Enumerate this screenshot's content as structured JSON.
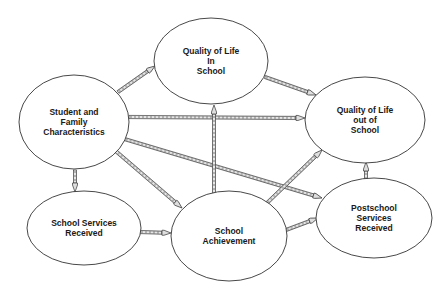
{
  "diagram": {
    "type": "path-model",
    "colors": {
      "stroke": "#333333",
      "arrow_fill": "#cfcfcf",
      "background": "#ffffff"
    },
    "nodes": [
      {
        "id": "qol_in",
        "lines": [
          "Quality of Life",
          "In",
          "School"
        ],
        "cx": 211,
        "cy": 61,
        "rx": 57,
        "ry": 43
      },
      {
        "id": "sfc",
        "lines": [
          "Student and",
          "Family",
          "Characteristics"
        ],
        "cx": 74,
        "cy": 122,
        "rx": 55,
        "ry": 47
      },
      {
        "id": "qol_out",
        "lines": [
          "Quality of Life",
          "out of",
          "School"
        ],
        "cx": 365,
        "cy": 120,
        "rx": 60,
        "ry": 43
      },
      {
        "id": "ssr",
        "lines": [
          "School Services",
          "Received"
        ],
        "cx": 84,
        "cy": 228,
        "rx": 57,
        "ry": 37
      },
      {
        "id": "sa",
        "lines": [
          "School",
          "Achievement"
        ],
        "cx": 229,
        "cy": 236,
        "rx": 58,
        "ry": 45
      },
      {
        "id": "psr",
        "lines": [
          "Postschool",
          "Services",
          "Received"
        ],
        "cx": 374,
        "cy": 218,
        "rx": 58,
        "ry": 40
      }
    ],
    "edges": [
      {
        "from": "sfc",
        "to": "qol_in",
        "x1": 118,
        "y1": 92,
        "x2": 155,
        "y2": 66
      },
      {
        "from": "sfc",
        "to": "qol_out",
        "x1": 129,
        "y1": 117,
        "x2": 305,
        "y2": 118
      },
      {
        "from": "sfc",
        "to": "ssr",
        "x1": 75,
        "y1": 170,
        "x2": 75,
        "y2": 192
      },
      {
        "from": "sfc",
        "to": "sa",
        "x1": 111,
        "y1": 147,
        "x2": 182,
        "y2": 208
      },
      {
        "from": "sfc",
        "to": "psr",
        "x1": 121,
        "y1": 138,
        "x2": 322,
        "y2": 198
      },
      {
        "from": "qol_in",
        "to": "qol_out",
        "x1": 265,
        "y1": 77,
        "x2": 316,
        "y2": 95
      },
      {
        "from": "sa",
        "to": "qol_in",
        "x1": 214,
        "y1": 195,
        "x2": 214,
        "y2": 105
      },
      {
        "from": "sa",
        "to": "qol_out",
        "x1": 267,
        "y1": 203,
        "x2": 322,
        "y2": 150
      },
      {
        "from": "sa",
        "to": "psr",
        "x1": 286,
        "y1": 230,
        "x2": 318,
        "y2": 218
      },
      {
        "from": "ssr",
        "to": "sa",
        "x1": 140,
        "y1": 232,
        "x2": 171,
        "y2": 233
      },
      {
        "from": "psr",
        "to": "qol_out",
        "x1": 366,
        "y1": 180,
        "x2": 366,
        "y2": 162
      }
    ]
  }
}
